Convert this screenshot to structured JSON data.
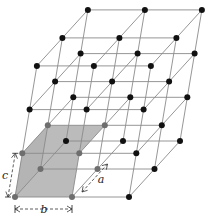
{
  "diagram": {
    "type": "crystal-lattice",
    "origin": [
      15,
      197
    ],
    "vectors": {
      "b": [
        57,
        0
      ],
      "a": [
        25.5,
        -28
      ],
      "c": [
        7.3,
        -43.7
      ]
    },
    "counts": {
      "b": 2,
      "a": 2,
      "c": 3
    },
    "unit_cell": {
      "b": 1,
      "a": 1,
      "c": 1
    },
    "colors": {
      "line": "#8a8a8a",
      "point": "#111111",
      "cell_point": "#6e6e6e",
      "cell_fill": "#b4b4b4",
      "dim": "#333333"
    },
    "labels": {
      "a": "a",
      "b": "b",
      "c": "c"
    }
  }
}
